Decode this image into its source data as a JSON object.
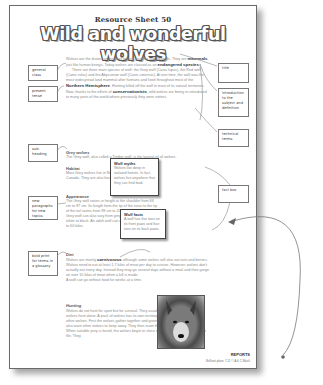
{
  "sheet": {
    "resource_label": "Resource Sheet 50",
    "title": "Wild and wonderful wolves",
    "footer_section": "REPORTS",
    "footer_small": "Brilliant plans 7-11 © A & C Black"
  },
  "intro": {
    "p1_a": "Wolves are the distant ancestor of today's poodles and spaniels.",
    "p1_b": "They are ",
    "p1_bold1": "mammals",
    "p1_c": ", just like human beings. Today wolves are classed as an ",
    "p1_bold2": "endangered species",
    "p1_d": ".",
    "p2_a": "There are three main species of wolf: the Grey wolf (Canis lupus), the Red wolf (Canis rufus) and the Abyssinian wolf (Canis simensis). At one time, the wolf was the most widespread land mammal after humans and lived throughout most of the ",
    "p2_bold1": "Northern Hemisphere",
    "p2_b": ". Hunting killed off the wolf in most of its natural territories. Now, thanks to the efforts of ",
    "p2_bold2": "conservationists",
    "p2_c": ", wild wolves are being re-introduced to many parts of the world where previously they were extinct."
  },
  "sections": {
    "grey": {
      "heading": "Grey wolves",
      "text": "The Grey wolf, also called a Timber wolf, is the largest of all wolves."
    },
    "habitat": {
      "heading": "Habitat",
      "text": "Most Grey wolves live in North America, in the USA and Canada. They are also found in Eastern Europe."
    },
    "appearance": {
      "heading": "Appearance",
      "text": "The Grey wolf varies in height at the shoulder from 66 cm to 97 cm. Its length from the tip of the nose to the tip of the tail varies from 99 cm to 203 cm. The coat of the Grey wolf can also vary from grey to brown and even white to black. An adult wolf can weigh from 26 kilos up to 60 kilos."
    },
    "diet": {
      "heading": "Diet",
      "text_a": "Wolves are mainly ",
      "bold": "carnivorous",
      "text_b": " although some wolves will also eat nuts and berries. Wolves need to eat at least 1.7 kilos of meat per day to survive. However, wolves don't actually eat every day. Instead they may go several days without a meal and then gorge on over 10 kilos of meat when a kill is made.",
      "text_c": "A wolf can go without food for weeks at a time."
    },
    "hunting": {
      "heading": "Hunting",
      "text_a": "Wolves do not hunt for sport but for survival. They usually hunt in ",
      "bold": "packs",
      "text_b": ", but some wolves hunt alone. A pack of wolves has its own territory which they defend from other wolves. First the wolves gather together and greet each other by howling. They also warn other wolves to keep away. They then roam their territory in search of prey. When suitable prey is found, the wolves begin to close in on the prey, usually in single file. They"
    }
  },
  "fact_boxes": [
    {
      "title": "Wolf myths",
      "text": "Wolves live deep in isolated forests. In fact, wolves live anywhere that they can find food."
    },
    {
      "title": "Wolf facts",
      "text": "A wolf has five toes on its front paws and four toes on its back paws."
    }
  ],
  "annotations_left": [
    {
      "label": "general class"
    },
    {
      "label": "present tense"
    },
    {
      "label": "sub-heading"
    },
    {
      "label": "new paragraphs for new topics"
    },
    {
      "label": "bold print for terms in a glossary"
    }
  ],
  "annotations_right": [
    {
      "label": "title"
    },
    {
      "label": "introduction to the subject and definition"
    },
    {
      "label": "technical terms"
    },
    {
      "label": "fact box"
    }
  ],
  "photo": {
    "alt": "grey wolf portrait"
  }
}
